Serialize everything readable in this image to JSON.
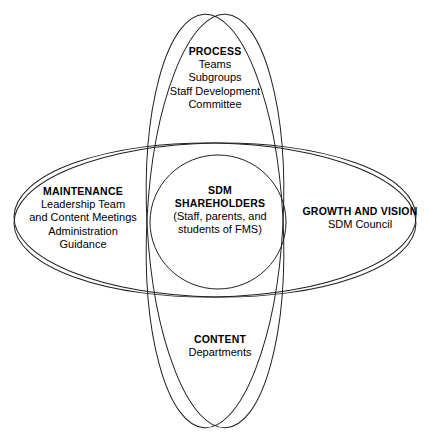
{
  "diagram": {
    "type": "venn",
    "stroke_color": "#231f20",
    "background_color": "#ffffff",
    "text_color": "#000000",
    "regions": [
      {
        "id": "process",
        "position": "top",
        "title": "PROCESS",
        "lines": [
          "Teams",
          "Subgroups",
          "Staff Development",
          "Committee"
        ]
      },
      {
        "id": "maintenance",
        "position": "left",
        "title": "MAINTENANCE",
        "lines": [
          "Leadership Team",
          "and Content Meetings",
          "Administration",
          "Guidance"
        ]
      },
      {
        "id": "growth-and-vision",
        "position": "right",
        "title": "GROWTH AND VISION",
        "lines": [
          "SDM Council"
        ]
      },
      {
        "id": "content",
        "position": "bottom",
        "title": "CONTENT",
        "lines": [
          "Departments"
        ]
      },
      {
        "id": "sdm-shareholders",
        "position": "center",
        "title_line_1": "SDM",
        "title_line_2": "SHAREHOLDERS",
        "lines": [
          "(Staff, parents, and",
          "students of FMS)"
        ]
      }
    ]
  }
}
